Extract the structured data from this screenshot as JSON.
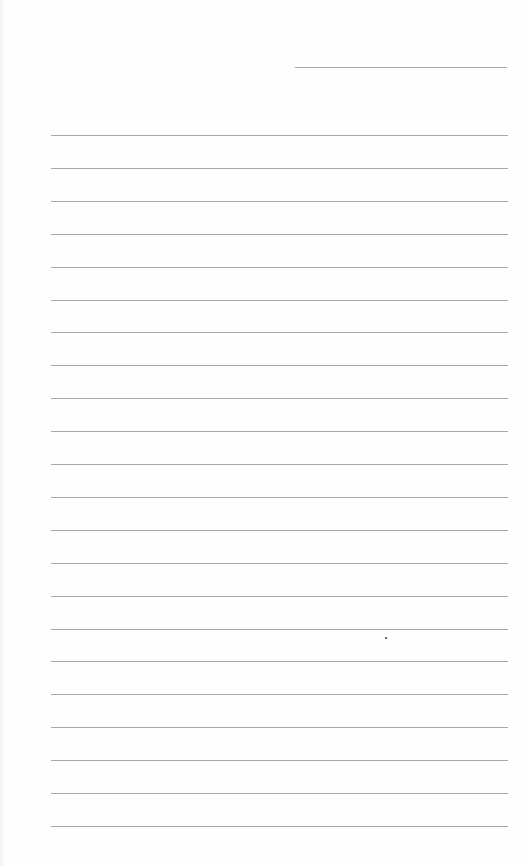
{
  "page": {
    "type": "lined-paper",
    "background_color": "#fefefe",
    "rule_color": "#a9a9a9",
    "name_line": {
      "x": 295,
      "y": 67,
      "width": 212
    },
    "rules": {
      "count": 22,
      "first_y": 135,
      "spacing": 32.9,
      "left": 51,
      "width": 457
    },
    "marks": [
      {
        "type": "dot",
        "x": 386,
        "y": 638,
        "color": "#333333"
      }
    ],
    "text": ""
  }
}
